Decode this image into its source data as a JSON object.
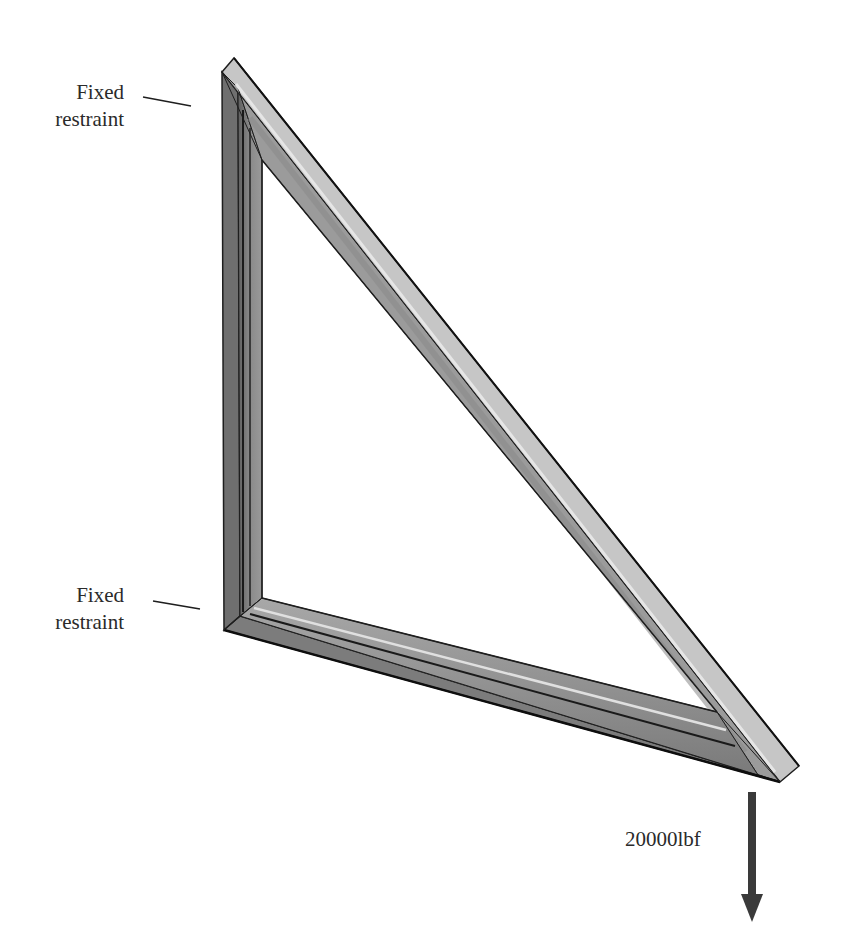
{
  "diagram": {
    "colors": {
      "background": "#ffffff",
      "frame_light": "#c4c4c4",
      "frame_mid": "#a3a3a3",
      "frame_dark": "#808080",
      "frame_darker": "#6a6a6a",
      "edge": "#1e1e1e",
      "highlight": "#e2e2e2",
      "arrow": "#3a3a3a",
      "text": "#2a2a2a"
    },
    "frame": {
      "shape": "right triangle frame (3 structural members)",
      "vertices": {
        "top_left": [
          222,
          72
        ],
        "bottom_left": [
          224,
          630
        ],
        "right_tip": [
          780,
          782
        ]
      },
      "inner_opening": {
        "top": [
          262,
          160
        ],
        "bottom_left": [
          262,
          598
        ],
        "right": [
          717,
          712
        ]
      }
    },
    "annotations": {
      "top_restraint": {
        "line1": "Fixed",
        "line2": "restraint",
        "leader": [
          [
            143,
            97
          ],
          [
            191,
            106
          ]
        ]
      },
      "bottom_restraint": {
        "line1": "Fixed",
        "line2": "restraint",
        "leader": [
          [
            153,
            601
          ],
          [
            200,
            609
          ]
        ]
      },
      "load": {
        "label": "20000lbf",
        "direction": "down",
        "arrow_start": [
          752,
          792
        ],
        "arrow_tip": [
          752,
          922
        ]
      }
    }
  }
}
